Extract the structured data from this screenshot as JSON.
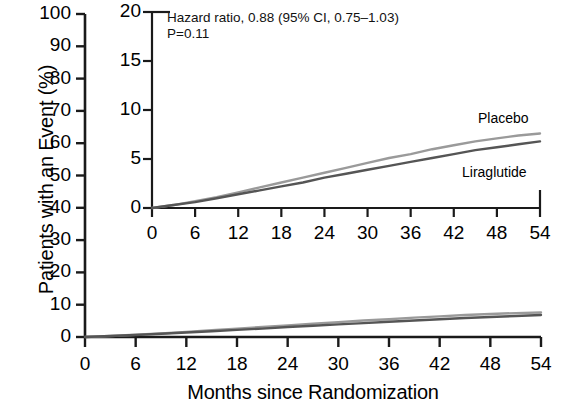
{
  "chart_data": {
    "type": "line",
    "title": "",
    "xlabel": "Months since Randomization",
    "ylabel": "Patients with an Event (%)",
    "xlim": [
      0,
      54
    ],
    "ylim": [
      0,
      100
    ],
    "xticks": [
      0,
      6,
      12,
      18,
      24,
      30,
      36,
      42,
      48,
      54
    ],
    "yticks": [
      0,
      10,
      20,
      30,
      40,
      50,
      60,
      70,
      80,
      90,
      100
    ],
    "xticklabels": [
      "0",
      "6",
      "12",
      "18",
      "24",
      "30",
      "36",
      "42",
      "48",
      "54"
    ],
    "yticklabels": [
      "0",
      "10",
      "20",
      "30",
      "40",
      "50",
      "60",
      "70",
      "80",
      "90",
      "100"
    ],
    "grid": false,
    "legend_position": "inline-curve-labels",
    "series": [
      {
        "name": "Placebo",
        "color": "#9a9a9a",
        "x": [
          0,
          3,
          6,
          9,
          12,
          15,
          18,
          21,
          24,
          27,
          30,
          33,
          36,
          39,
          42,
          45,
          48,
          51,
          54
        ],
        "values": [
          0.0,
          0.3,
          0.7,
          1.1,
          1.6,
          2.1,
          2.6,
          3.1,
          3.6,
          4.1,
          4.6,
          5.1,
          5.5,
          6.0,
          6.4,
          6.8,
          7.1,
          7.4,
          7.6
        ]
      },
      {
        "name": "Liraglutide",
        "color": "#555555",
        "x": [
          0,
          3,
          6,
          9,
          12,
          15,
          18,
          21,
          24,
          27,
          30,
          33,
          36,
          39,
          42,
          45,
          48,
          51,
          54
        ],
        "values": [
          0.0,
          0.3,
          0.6,
          1.0,
          1.4,
          1.8,
          2.2,
          2.6,
          3.1,
          3.5,
          3.9,
          4.3,
          4.7,
          5.1,
          5.5,
          5.9,
          6.2,
          6.5,
          6.8
        ]
      }
    ],
    "inset": {
      "type": "line",
      "xlim": [
        0,
        54
      ],
      "ylim": [
        0,
        20
      ],
      "xticks": [
        0,
        6,
        12,
        18,
        24,
        30,
        36,
        42,
        48,
        54
      ],
      "yticks": [
        0,
        5,
        10,
        15,
        20
      ],
      "xticklabels": [
        "0",
        "6",
        "12",
        "18",
        "24",
        "30",
        "36",
        "42",
        "48",
        "54"
      ],
      "yticklabels": [
        "0",
        "5",
        "10",
        "15",
        "20"
      ],
      "grid": false,
      "annotations": [
        "Hazard ratio, 0.88 (95% CI, 0.75–1.03)",
        "P=0.11"
      ],
      "series_labels": [
        "Placebo",
        "Liraglutide"
      ]
    }
  },
  "colors": {
    "placebo": "#9a9a9a",
    "liraglutide": "#555555",
    "axis": "#1a1a1a",
    "background": "#ffffff"
  }
}
